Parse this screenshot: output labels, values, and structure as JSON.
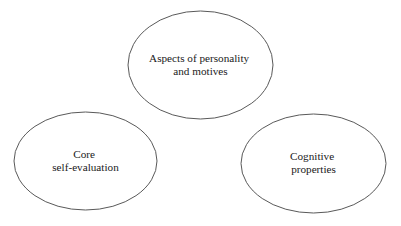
{
  "diagram": {
    "type": "venn-like-ellipse-cluster",
    "background_color": "#ffffff",
    "stroke_color": "#595959",
    "text_color": "#1a1a1a",
    "nodes": [
      {
        "id": "aspects-of-personality-and-motives",
        "lines": [
          "Aspects of personality",
          "and motives"
        ],
        "line1": "Aspects of personality",
        "line2": "and motives",
        "cx": 200.5,
        "cy": 65,
        "rx": 72.5,
        "ry": 54,
        "text_y1": 62,
        "text_y2": 75
      },
      {
        "id": "core-self-evaluation",
        "lines": [
          "Core",
          "self-evaluation"
        ],
        "line1": "Core",
        "line2": "self-evaluation",
        "cx": 85.5,
        "cy": 161,
        "rx": 71.5,
        "ry": 49,
        "text_y1": 158,
        "text_y2": 171
      },
      {
        "id": "cognitive-properties",
        "lines": [
          "Cognitive",
          "properties"
        ],
        "line1": "Cognitive",
        "line2": "properties",
        "cx": 313.5,
        "cy": 163.5,
        "rx": 72.5,
        "ry": 49.5,
        "text_y1": 160,
        "text_y2": 173
      }
    ]
  }
}
